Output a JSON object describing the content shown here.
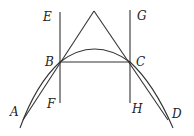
{
  "diagram": {
    "type": "geometry",
    "colors": {
      "stroke": "#333333",
      "label": "#222222",
      "background": "#ffffff"
    },
    "points": {
      "A": {
        "label": "A"
      },
      "B": {
        "label": "B"
      },
      "C": {
        "label": "C"
      },
      "D": {
        "label": "D"
      },
      "E": {
        "label": "E"
      },
      "F": {
        "label": "F"
      },
      "G": {
        "label": "G"
      },
      "H": {
        "label": "H"
      }
    },
    "labels": [
      "E",
      "G",
      "B",
      "C",
      "F",
      "H",
      "A",
      "D"
    ]
  }
}
